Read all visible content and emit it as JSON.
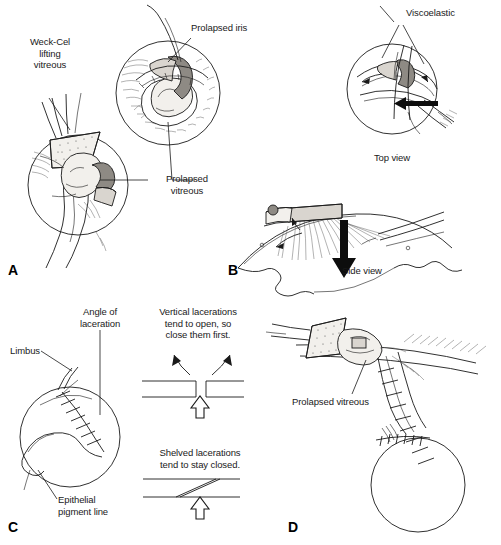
{
  "figure": {
    "background_color": "#ffffff",
    "ink_color": "#1a1a1a",
    "width": 501,
    "height": 545
  },
  "panels": [
    {
      "letter": "A",
      "name": "panel-a",
      "description": "Weck-Cel sponge lifting prolapsed vitreous from wound, with magnified inset of globe showing prolapsed iris and vitreous",
      "labels": [
        {
          "id": "weck-cel",
          "text": "Weck-Cel\nlifting\nvitreous",
          "align": "center"
        },
        {
          "id": "prolapsed-iris",
          "text": "Prolapsed iris",
          "align": "left"
        },
        {
          "id": "prolapsed-vitreous",
          "text": "Prolapsed\nvitreous",
          "align": "center"
        }
      ]
    },
    {
      "letter": "B",
      "name": "panel-b",
      "description": "Viscoelastic injected to reposit iris; top view and side view of the wound",
      "labels": [
        {
          "id": "viscoelastic",
          "text": "Viscoelastic",
          "align": "left"
        },
        {
          "id": "top-view",
          "text": "Top view",
          "align": "center"
        },
        {
          "id": "side-view",
          "text": "Side view",
          "align": "center"
        }
      ]
    },
    {
      "letter": "C",
      "name": "panel-c",
      "description": "Globe with sutured laceration showing limbus, angle of laceration, epithelial pigment line; diagrams of vertical versus shelved lacerations",
      "labels": [
        {
          "id": "angle-of-laceration",
          "text": "Angle of\nlaceration",
          "align": "center"
        },
        {
          "id": "limbus",
          "text": "Limbus",
          "align": "right"
        },
        {
          "id": "epithelial-pigment-line",
          "text": "Epithelial\npigment line",
          "align": "left"
        },
        {
          "id": "vertical-note",
          "text": "Vertical lacerations\ntend to open, so\nclose them first.",
          "align": "center"
        },
        {
          "id": "shelved-note",
          "text": "Shelved lacerations\ntend to stay closed.",
          "align": "center"
        }
      ]
    },
    {
      "letter": "D",
      "name": "panel-d",
      "description": "Sponge sweeping prolapsed vitreous from the sutured wound with globe below",
      "labels": [
        {
          "id": "prolapsed-vitreous-d",
          "text": "Prolapsed vitreous",
          "align": "left"
        }
      ]
    }
  ],
  "labels": {
    "weck_cel": "Weck-Cel\nlifting\nvitreous",
    "prolapsed_iris": "Prolapsed iris",
    "prolapsed_vitreous": "Prolapsed\nvitreous",
    "viscoelastic": "Viscoelastic",
    "top_view": "Top view",
    "side_view": "Side view",
    "angle_of_laceration": "Angle of\nlaceration",
    "limbus": "Limbus",
    "epithelial_pigment_line": "Epithelial\npigment line",
    "vertical_lacerations": "Vertical lacerations\ntend to open, so\nclose them first.",
    "shelved_lacerations": "Shelved lacerations\ntend to stay closed.",
    "prolapsed_vitreous_d": "Prolapsed vitreous"
  },
  "panel_letters": {
    "a": "A",
    "b": "B",
    "c": "C",
    "d": "D"
  }
}
